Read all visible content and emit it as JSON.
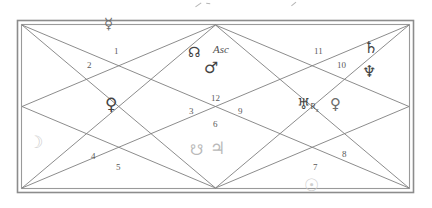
{
  "chart_data": {
    "type": "diagram",
    "style": "north-indian-diamond",
    "frame": {
      "border_color": "#8a8a8a",
      "line_color": "#7f7f7f",
      "background": "#ffffff"
    },
    "house_numbers": [
      {
        "id": "h1",
        "label": "1",
        "x": 114,
        "y": 47
      },
      {
        "id": "h2",
        "label": "2",
        "x": 87,
        "y": 61
      },
      {
        "id": "h3",
        "label": "3",
        "x": 189,
        "y": 107
      },
      {
        "id": "h4",
        "label": "4",
        "x": 91,
        "y": 152
      },
      {
        "id": "h5",
        "label": "5",
        "x": 116,
        "y": 163
      },
      {
        "id": "h6",
        "label": "6",
        "x": 213,
        "y": 120
      },
      {
        "id": "h7",
        "label": "7",
        "x": 313,
        "y": 163
      },
      {
        "id": "h8",
        "label": "8",
        "x": 342,
        "y": 150
      },
      {
        "id": "h9",
        "label": "9",
        "x": 238,
        "y": 107
      },
      {
        "id": "h10",
        "label": "10",
        "x": 337,
        "y": 61
      },
      {
        "id": "h11",
        "label": "11",
        "x": 314,
        "y": 47
      },
      {
        "id": "h12",
        "label": "12",
        "x": 211,
        "y": 94
      }
    ],
    "planets": [
      {
        "id": "mercury",
        "name": "Mercury",
        "glyph": "☿",
        "house": 1,
        "x": 104,
        "y": 16,
        "size": 15,
        "tone": "glyph-mid",
        "retrograde": false
      },
      {
        "id": "rahu",
        "name": "Rahu (North Node)",
        "glyph": "☊",
        "house": 12,
        "x": 188,
        "y": 44,
        "size": 14,
        "tone": "glyph-dark",
        "retrograde": false
      },
      {
        "id": "mars",
        "name": "Mars",
        "glyph": "♂",
        "house": 12,
        "x": 204,
        "y": 60,
        "size": 16,
        "tone": "glyph-dark",
        "retrograde": false
      },
      {
        "id": "saturn",
        "name": "Saturn",
        "glyph": "♄",
        "house": 10,
        "x": 364,
        "y": 40,
        "size": 16,
        "tone": "glyph-dark",
        "retrograde": false
      },
      {
        "id": "neptune",
        "name": "Neptune",
        "glyph": "♆",
        "house": 10,
        "x": 362,
        "y": 64,
        "size": 16,
        "tone": "glyph-dark",
        "retrograde": false
      },
      {
        "id": "uranus",
        "name": "Uranus",
        "glyph": "♅",
        "house": 9,
        "x": 297,
        "y": 96,
        "size": 15,
        "tone": "glyph-dark",
        "retrograde": true
      },
      {
        "id": "venus",
        "name": "Venus",
        "glyph": "♀",
        "house": 9,
        "x": 330,
        "y": 96,
        "size": 15,
        "tone": "glyph-mid",
        "retrograde": false
      },
      {
        "id": "pluto",
        "name": "Pluto",
        "glyph": "♀",
        "house": 2,
        "x": 105,
        "y": 96,
        "size": 17,
        "tone": "glyph-dark",
        "retrograde": false
      },
      {
        "id": "moon",
        "name": "Moon",
        "glyph": "☽",
        "house": 3,
        "x": 28,
        "y": 134,
        "size": 17,
        "tone": "glyph-faint",
        "retrograde": false
      },
      {
        "id": "ketu",
        "name": "Ketu (South Node)",
        "glyph": "☋",
        "house": 6,
        "x": 190,
        "y": 142,
        "size": 15,
        "tone": "glyph-light",
        "retrograde": false
      },
      {
        "id": "jupiter",
        "name": "Jupiter",
        "glyph": "♃",
        "house": 6,
        "x": 210,
        "y": 140,
        "size": 17,
        "tone": "glyph-light",
        "retrograde": false
      },
      {
        "id": "sun",
        "name": "Sun",
        "glyph": "☉",
        "house": 7,
        "x": 304,
        "y": 177,
        "size": 17,
        "tone": "glyph-faint",
        "retrograde": false
      }
    ],
    "labels": [
      {
        "id": "ascendant",
        "text": "Asc",
        "house": 12,
        "x": 213,
        "y": 44
      }
    ],
    "retrograde_marker": {
      "text": "R",
      "subscript": "x"
    },
    "edge_marks": [
      {
        "id": "tick-a",
        "x": 196,
        "y": 4,
        "w": 7,
        "h": 4,
        "rot": -35
      },
      {
        "id": "tick-b",
        "x": 206,
        "y": 3,
        "w": 4,
        "h": 5,
        "rot": 5
      },
      {
        "id": "tick-c",
        "x": 292,
        "y": 3,
        "w": 6,
        "h": 4,
        "rot": -40
      }
    ]
  }
}
